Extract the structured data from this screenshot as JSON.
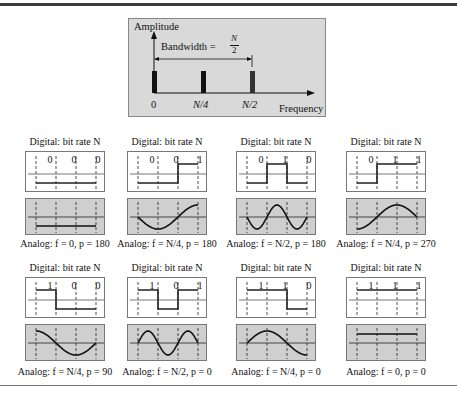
{
  "spectrum": {
    "y_label": "Amplitude",
    "x_label": "Frequency",
    "bandwidth_label": "Bandwidth =",
    "bandwidth_num": "N",
    "bandwidth_den": "2",
    "ticks": [
      "0",
      "N/4",
      "N/2"
    ]
  },
  "panels": [
    {
      "title": "Digital: bit rate N",
      "bits": [
        "0",
        "0",
        "0"
      ],
      "caption": "Analog: f = 0, p = 180"
    },
    {
      "title": "Digital: bit rate N",
      "bits": [
        "0",
        "0",
        "1"
      ],
      "caption": "Analog: f = N/4, p = 180"
    },
    {
      "title": "Digital: bit rate N",
      "bits": [
        "0",
        "1",
        "0"
      ],
      "caption": "Analog: f = N/2, p = 180"
    },
    {
      "title": "Digital: bit rate N",
      "bits": [
        "0",
        "1",
        "1"
      ],
      "caption": "Analog: f = N/4, p = 270"
    },
    {
      "title": "Digital: bit rate N",
      "bits": [
        "1",
        "0",
        "0"
      ],
      "caption": "Analog: f = N/4, p = 90"
    },
    {
      "title": "Digital: bit rate N",
      "bits": [
        "1",
        "0",
        "1"
      ],
      "caption": "Analog: f = N/2, p = 0"
    },
    {
      "title": "Digital: bit rate N",
      "bits": [
        "1",
        "1",
        "0"
      ],
      "caption": "Analog: f = N/4, p = 0"
    },
    {
      "title": "Digital: bit rate N",
      "bits": [
        "1",
        "1",
        "1"
      ],
      "caption": "Analog: f = 0, p = 0"
    }
  ]
}
